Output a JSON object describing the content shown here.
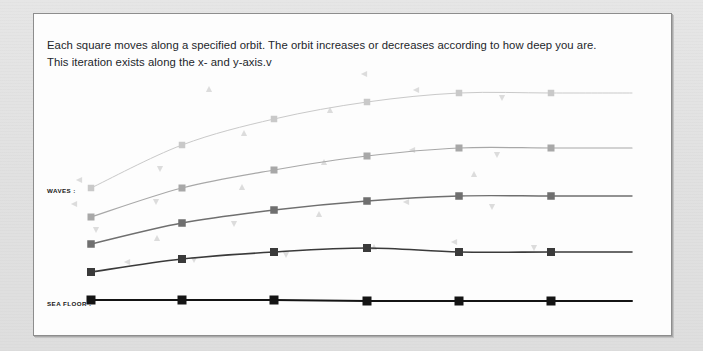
{
  "caption": {
    "line1": "Each square moves along a specified orbit. The orbit increases or decreases according to how deep you are.",
    "line2": "This iteration exists along the x- and y-axis.v"
  },
  "axis_labels": {
    "waves": "WAVES :",
    "sea_floor": "SEA FLOOR :"
  },
  "colors": {
    "page_background": "#e3e3e3",
    "panel_background": "#fdfdfd",
    "panel_border": "#8d8d8d",
    "text": "#23262b",
    "series_1": "#c9c9c9",
    "series_2": "#a8a8a8",
    "series_3": "#6f6f6f",
    "series_4": "#3a3a3a",
    "series_5": "#141414",
    "scatter_glyph": "#dcdcdc"
  },
  "chart_data": {
    "type": "line",
    "title": "",
    "subtitle": "",
    "xlabel": "",
    "ylabel": "",
    "grid": false,
    "legend_position": "left-axis-labels",
    "xlim": [
      0,
      639
    ],
    "ylim": [
      323,
      0
    ],
    "note": "Five stacked orbit curves, pixel coordinates in panel space. y increases downward. Each series has 6 square markers plus a flat tail extending to the right edge.",
    "x": [
      57,
      148,
      240,
      333,
      425,
      517,
      598
    ],
    "series": [
      {
        "name": "orbit-1-shallowest",
        "label": "WAVES",
        "color": "#c9c9c9",
        "line_width": 1.0,
        "marker": "square",
        "marker_size": 6.5,
        "values": [
          174,
          131,
          105,
          88,
          79,
          79,
          79
        ]
      },
      {
        "name": "orbit-2",
        "label": "",
        "color": "#a8a8a8",
        "line_width": 1.2,
        "marker": "square",
        "marker_size": 7,
        "values": [
          203,
          174,
          156,
          142,
          134,
          134,
          134
        ]
      },
      {
        "name": "orbit-3",
        "label": "",
        "color": "#6f6f6f",
        "line_width": 1.4,
        "marker": "square",
        "marker_size": 7.5,
        "values": [
          230,
          209,
          196,
          187,
          182,
          182,
          182
        ]
      },
      {
        "name": "orbit-4",
        "label": "",
        "color": "#3a3a3a",
        "line_width": 1.6,
        "marker": "square",
        "marker_size": 8,
        "values": [
          258,
          245,
          238,
          234,
          238,
          238,
          238
        ]
      },
      {
        "name": "orbit-5-sea-floor",
        "label": "SEA FLOOR",
        "color": "#141414",
        "line_width": 2.0,
        "marker": "square",
        "marker_size": 9,
        "values": [
          286,
          286,
          286,
          287,
          287,
          287,
          287
        ]
      }
    ],
    "scatter_glyphs": {
      "description": "faint decorative triangle glyphs scattered across the plot",
      "color": "#dcdcdc",
      "points": [
        {
          "x": 45,
          "y": 166,
          "dir": "left"
        },
        {
          "x": 40,
          "y": 190,
          "dir": "left"
        },
        {
          "x": 62,
          "y": 216,
          "dir": "down"
        },
        {
          "x": 93,
          "y": 248,
          "dir": "left"
        },
        {
          "x": 126,
          "y": 155,
          "dir": "down"
        },
        {
          "x": 122,
          "y": 188,
          "dir": "down"
        },
        {
          "x": 123,
          "y": 224,
          "dir": "up"
        },
        {
          "x": 160,
          "y": 246,
          "dir": "down"
        },
        {
          "x": 210,
          "y": 119,
          "dir": "up"
        },
        {
          "x": 208,
          "y": 173,
          "dir": "up"
        },
        {
          "x": 200,
          "y": 210,
          "dir": "down"
        },
        {
          "x": 252,
          "y": 241,
          "dir": "down"
        },
        {
          "x": 296,
          "y": 96,
          "dir": "up"
        },
        {
          "x": 290,
          "y": 148,
          "dir": "up"
        },
        {
          "x": 285,
          "y": 200,
          "dir": "up"
        },
        {
          "x": 340,
          "y": 233,
          "dir": "up"
        },
        {
          "x": 382,
          "y": 76,
          "dir": "left"
        },
        {
          "x": 378,
          "y": 136,
          "dir": "left"
        },
        {
          "x": 372,
          "y": 188,
          "dir": "left"
        },
        {
          "x": 420,
          "y": 228,
          "dir": "left"
        },
        {
          "x": 468,
          "y": 84,
          "dir": "down"
        },
        {
          "x": 463,
          "y": 141,
          "dir": "down"
        },
        {
          "x": 458,
          "y": 193,
          "dir": "down"
        },
        {
          "x": 500,
          "y": 234,
          "dir": "down"
        },
        {
          "x": 175,
          "y": 75,
          "dir": "up"
        },
        {
          "x": 330,
          "y": 60,
          "dir": "left"
        },
        {
          "x": 440,
          "y": 160,
          "dir": "up"
        }
      ]
    }
  }
}
